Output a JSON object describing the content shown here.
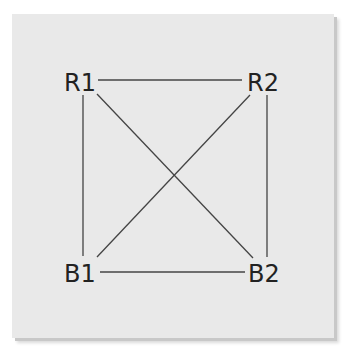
{
  "diagram": {
    "nodes": [
      {
        "id": "R1",
        "label": "R1",
        "x": 78,
        "y": 80
      },
      {
        "id": "R2",
        "label": "R2",
        "x": 266,
        "y": 80
      },
      {
        "id": "B1",
        "label": "B1",
        "x": 80,
        "y": 271
      },
      {
        "id": "B2",
        "label": "B2",
        "x": 266,
        "y": 271
      }
    ],
    "edges": [
      {
        "from": "R1",
        "to": "R2"
      },
      {
        "from": "R1",
        "to": "B1"
      },
      {
        "from": "R1",
        "to": "B2"
      },
      {
        "from": "R2",
        "to": "B1"
      },
      {
        "from": "R2",
        "to": "B2"
      },
      {
        "from": "B1",
        "to": "B2"
      }
    ],
    "colors": {
      "background": "#e9e9e9",
      "line": "#444444",
      "text": "#222222"
    }
  }
}
